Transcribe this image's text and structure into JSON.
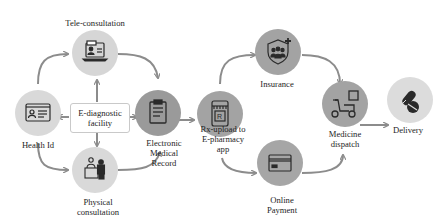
{
  "diagram": {
    "nodes": [
      {
        "id": "teleconsultation",
        "label_lines": [
          "Tele-consultation"
        ],
        "icon": "laptop-doctor-icon",
        "fill": "#d6d6d6"
      },
      {
        "id": "health-id",
        "label_lines": [
          "Health Id"
        ],
        "icon": "id-card-icon",
        "fill": "#d9d9d9"
      },
      {
        "id": "emr",
        "label_lines": [
          "Electronic",
          "Medical",
          "Record"
        ],
        "icon": "clipboard-icon",
        "fill": "#9a9a9a"
      },
      {
        "id": "physical-consultation",
        "label_lines": [
          "Physical",
          "consultation"
        ],
        "icon": "doctor-patient-desk-icon",
        "fill": "#d9d9d9"
      },
      {
        "id": "rx-upload",
        "label_lines": [
          "Rx-upload to",
          "E-pharmacy",
          "app"
        ],
        "icon": "pharmacy-phone-icon",
        "fill": "#a3a3a3"
      },
      {
        "id": "insurance",
        "label_lines": [
          "Insurance"
        ],
        "icon": "shield-family-icon",
        "fill": "#a3a3a3"
      },
      {
        "id": "online-payment",
        "label_lines": [
          "Online",
          "Payment"
        ],
        "icon": "credit-card-icon",
        "fill": "#a6a6a6"
      },
      {
        "id": "medicine-dispatch",
        "label_lines": [
          "Medicine",
          "dispatch"
        ],
        "icon": "scooter-delivery-icon",
        "fill": "#a3a3a3"
      },
      {
        "id": "delivery",
        "label_lines": [
          "Delivery"
        ],
        "icon": "pill-capsule-icon",
        "fill": "#dcdcdc"
      }
    ],
    "center_box": {
      "label_lines": [
        "E-diagnostic",
        "facility"
      ]
    },
    "edges": [
      {
        "from": "health-id",
        "to": "teleconsultation"
      },
      {
        "from": "teleconsultation",
        "to": "emr"
      },
      {
        "from": "health-id",
        "to": "physical-consultation"
      },
      {
        "from": "physical-consultation",
        "to": "emr"
      },
      {
        "from": "center-box",
        "to": "teleconsultation"
      },
      {
        "from": "center-box",
        "to": "health-id"
      },
      {
        "from": "center-box",
        "to": "emr"
      },
      {
        "from": "center-box",
        "to": "physical-consultation"
      },
      {
        "from": "emr",
        "to": "rx-upload"
      },
      {
        "from": "rx-upload",
        "to": "insurance"
      },
      {
        "from": "rx-upload",
        "to": "online-payment"
      },
      {
        "from": "insurance",
        "to": "medicine-dispatch"
      },
      {
        "from": "online-payment",
        "to": "medicine-dispatch"
      },
      {
        "from": "medicine-dispatch",
        "to": "delivery"
      }
    ],
    "colors": {
      "arrow": "#8c8c8c",
      "icon": "#2a2a2a",
      "light_node": "#d8d8d8",
      "dark_node": "#a0a0a0"
    }
  }
}
